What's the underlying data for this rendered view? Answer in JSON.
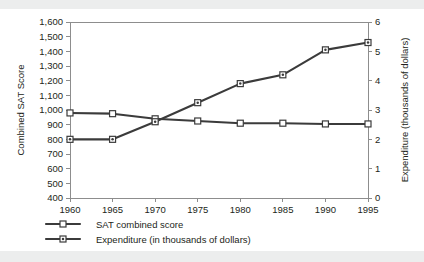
{
  "chart_data": {
    "type": "line",
    "title": "",
    "xlabel": "",
    "ylabel": "Combined SAT Score",
    "y2label": "Expenditure (thousands of dollars)",
    "categories": [
      1960,
      1965,
      1970,
      1975,
      1980,
      1985,
      1990,
      1995
    ],
    "x": [
      "1960",
      "1965",
      "1970",
      "1975",
      "1980",
      "1985",
      "1990",
      "1995"
    ],
    "xlim": [
      1960,
      1995
    ],
    "ylim": [
      400,
      1600
    ],
    "y2lim": [
      0,
      6
    ],
    "yticks": [
      "400",
      "500",
      "600",
      "700",
      "800",
      "900",
      "1,000",
      "1,100",
      "1,200",
      "1,300",
      "1,400",
      "1,500",
      "1,600"
    ],
    "ytick_values": [
      400,
      500,
      600,
      700,
      800,
      900,
      1000,
      1100,
      1200,
      1300,
      1400,
      1500,
      1600
    ],
    "y2ticks": [
      "0",
      "1",
      "2",
      "3",
      "4",
      "5",
      "6"
    ],
    "y2tick_values": [
      0,
      1,
      2,
      3,
      4,
      5,
      6
    ],
    "grid": false,
    "legend_position": "bottom-left",
    "series": [
      {
        "name": "SAT combined score",
        "axis": "left",
        "marker": "open-square",
        "values": [
          980,
          975,
          940,
          925,
          910,
          910,
          905,
          905
        ]
      },
      {
        "name": "Expenditure (in thousands of dollars)",
        "axis": "right",
        "marker": "dotted-square",
        "values": [
          2.0,
          2.0,
          2.6,
          3.25,
          3.9,
          4.2,
          5.05,
          5.3
        ]
      }
    ]
  },
  "legend": {
    "items": [
      {
        "label": "SAT combined score"
      },
      {
        "label": "Expenditure (in thousands of dollars)"
      }
    ]
  },
  "colors": {
    "series": "#3b3b3b",
    "axis": "#8d8d8d",
    "text": "#231f20",
    "band": "#eceded",
    "plot_background": "#ffffff"
  }
}
